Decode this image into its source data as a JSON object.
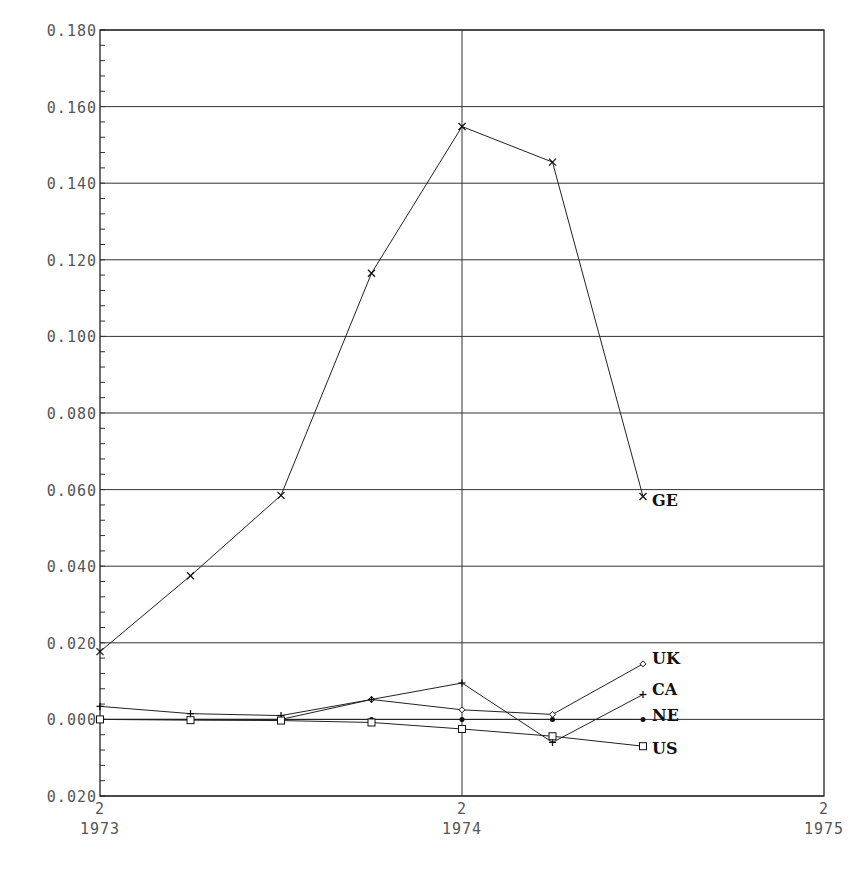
{
  "chart_data": {
    "type": "line",
    "title": "",
    "xlabel": "",
    "ylabel": "",
    "x": [
      "1973 Q2",
      "1973 Q3",
      "1973 Q4",
      "1974 Q1",
      "1974 Q2",
      "1974 Q3",
      "1974 Q4"
    ],
    "x_ticks": [
      {
        "top": "2",
        "bottom": "1973"
      },
      {
        "top": "2",
        "bottom": "1974"
      },
      {
        "top": "2",
        "bottom": "1975"
      }
    ],
    "y_ticks": [
      "0.180",
      "0.160",
      "0.140",
      "0.120",
      "0.100",
      "0.080",
      "0.060",
      "0.040",
      "0.020",
      "0.000",
      "0.020"
    ],
    "y_tick_values": [
      0.18,
      0.16,
      0.14,
      0.12,
      0.1,
      0.08,
      0.06,
      0.04,
      0.02,
      0.0,
      -0.02
    ],
    "ylim": [
      -0.02,
      0.18
    ],
    "xlim": [
      "1973 Q2",
      "1975 Q2"
    ],
    "grid": {
      "horizontal": true,
      "vertical_at": [
        "1974 Q2"
      ]
    },
    "legend_position": "inline-right-of-last-point",
    "series": [
      {
        "name": "GE",
        "marker": "x",
        "values": [
          0.0177,
          0.0375,
          0.0585,
          0.1165,
          0.1548,
          0.1455,
          0.0582
        ]
      },
      {
        "name": "UK",
        "marker": "diamond",
        "values": [
          0.0,
          0.0,
          0.0,
          0.0052,
          0.0025,
          0.0013,
          0.0145
        ]
      },
      {
        "name": "CA",
        "marker": "plus",
        "values": [
          0.0034,
          0.0015,
          0.001,
          0.0052,
          0.0095,
          -0.006,
          0.0065
        ]
      },
      {
        "name": "NE",
        "marker": "dot",
        "values": [
          0.0,
          0.0,
          0.0,
          0.0,
          0.0,
          0.0,
          0.0
        ]
      },
      {
        "name": "US",
        "marker": "square",
        "values": [
          0.0,
          -0.0002,
          -0.0003,
          -0.0008,
          -0.0025,
          -0.0044,
          -0.007
        ]
      }
    ]
  },
  "colors": {
    "line": "#222222",
    "grid": "#333333",
    "tick_text": "#555555",
    "background": "#ffffff"
  }
}
